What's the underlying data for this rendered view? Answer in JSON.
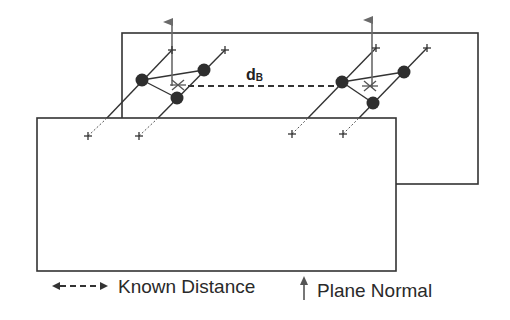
{
  "diagram": {
    "distance_label": "d",
    "distance_subscript": "B",
    "colors": {
      "outline": "#333333",
      "marker": "#333333",
      "normal_arrow": "#6a6a6a",
      "background": "#ffffff"
    },
    "planes": [
      {
        "name": "back-plane",
        "x": 122,
        "y": 33,
        "w": 356,
        "h": 151
      },
      {
        "name": "front-plane",
        "x": 37,
        "y": 118,
        "w": 359,
        "h": 153
      }
    ],
    "clusters": [
      {
        "name": "left-cluster",
        "normal_x": 172
      },
      {
        "name": "right-cluster",
        "normal_x": 372
      }
    ]
  },
  "legend": {
    "known_distance_label": "Known Distance",
    "plane_normal_label": "Plane Normal"
  }
}
